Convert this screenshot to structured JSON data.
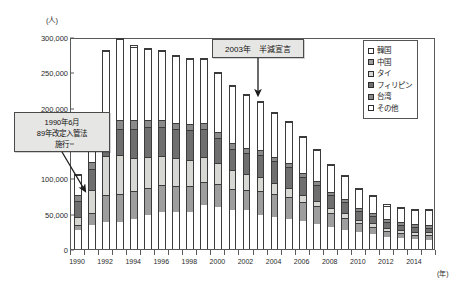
{
  "chart_data": {
    "type": "bar",
    "stacked": true,
    "title": "",
    "subtitle": "",
    "xlabel": "(年)",
    "ylabel": "(人)",
    "ylim": [
      0,
      300000
    ],
    "ytick_values": [
      0,
      50000,
      100000,
      150000,
      200000,
      250000,
      300000
    ],
    "ytick_labels": [
      "0",
      "50,000",
      "100,000",
      "150,000",
      "200,000",
      "250,000",
      "300,000"
    ],
    "grid": false,
    "legend_position": "top-right",
    "categories": [
      "1990",
      "1991",
      "1992",
      "1993",
      "1994",
      "1995",
      "1996",
      "1997",
      "1998",
      "1999",
      "2000",
      "2001",
      "2002",
      "2003",
      "2004",
      "2005",
      "2006",
      "2007",
      "2008",
      "2009",
      "2010",
      "2011",
      "2012",
      "2013",
      "2014",
      "2015"
    ],
    "xtick_labels": [
      "1990",
      "1992",
      "1994",
      "1996",
      "1998",
      "2000",
      "2002",
      "2004",
      "2006",
      "2008",
      "2010",
      "2012",
      "2014"
    ],
    "series": [
      {
        "name": "韓国",
        "color": "#ffffff",
        "values": [
          27000,
          35000,
          38000,
          39000,
          43000,
          48000,
          52000,
          52000,
          52000,
          62000,
          60000,
          56000,
          55000,
          49000,
          46000,
          43000,
          40000,
          36000,
          31000,
          27000,
          24000,
          22000,
          18000,
          16000,
          14000,
          13000
        ]
      },
      {
        "name": "中国",
        "color": "#9e9e9e",
        "values": [
          8000,
          17000,
          39000,
          39000,
          39000,
          39000,
          39000,
          38000,
          37000,
          34000,
          32000,
          30000,
          29000,
          33000,
          32000,
          31000,
          27000,
          25000,
          21000,
          18000,
          13000,
          10000,
          8000,
          7000,
          7000,
          8000
        ]
      },
      {
        "name": "タイ",
        "color": "#d7d7d4",
        "values": [
          11000,
          32000,
          55000,
          55000,
          47000,
          44000,
          41000,
          39000,
          38000,
          35000,
          30000,
          26000,
          23000,
          20000,
          16000,
          13000,
          10000,
          8000,
          7000,
          6000,
          5000,
          5000,
          4000,
          4000,
          4000,
          4000
        ]
      },
      {
        "name": "フィリピン",
        "color": "#6f6f6f",
        "values": [
          23000,
          30000,
          35000,
          38000,
          42000,
          42000,
          42000,
          42000,
          42000,
          40000,
          36000,
          31000,
          30000,
          32000,
          31000,
          30000,
          26000,
          23000,
          19000,
          17000,
          13000,
          11000,
          9000,
          8000,
          7000,
          6000
        ]
      },
      {
        "name": "台湾",
        "color": "#8a8a8a",
        "values": [
          9000,
          10000,
          11000,
          12000,
          12000,
          11000,
          10000,
          9000,
          9000,
          9000,
          8000,
          8000,
          7000,
          7000,
          6000,
          6000,
          5000,
          5000,
          4000,
          4000,
          4000,
          4000,
          4000,
          4000,
          4000,
          4000
        ]
      },
      {
        "name": "その他",
        "color": "#ffffff",
        "values": [
          28000,
          36000,
          104000,
          115000,
          105000,
          101000,
          98000,
          95000,
          93000,
          90000,
          85000,
          81000,
          76000,
          69000,
          63000,
          58000,
          52000,
          45000,
          38000,
          33000,
          27000,
          24000,
          20000,
          20000,
          21000,
          22000
        ]
      }
    ],
    "totals": [
      106000,
      160000,
      282000,
      298000,
      288000,
      285000,
      282000,
      275000,
      271000,
      270000,
      251000,
      232000,
      220000,
      210000,
      194000,
      181000,
      160000,
      142000,
      120000,
      105000,
      86000,
      76000,
      63000,
      59000,
      57000,
      57000
    ],
    "annotations": [
      {
        "id": "callout-1990",
        "lines": [
          "1990年6月",
          "89年改定入管法",
          "施行"
        ],
        "target_category": "1990"
      },
      {
        "id": "callout-2003",
        "lines": [
          "2003年　半減宣言"
        ],
        "target_category": "2003"
      }
    ]
  },
  "axes": {
    "y_unit": "(人)",
    "x_unit": "(年)"
  },
  "legend": {
    "items": [
      {
        "label": "韓国",
        "swatch": "korea-swatch"
      },
      {
        "label": "中国",
        "swatch": "china-swatch"
      },
      {
        "label": "タイ",
        "swatch": "thailand-swatch"
      },
      {
        "label": "フィリピン",
        "swatch": "philippines-swatch"
      },
      {
        "label": "台湾",
        "swatch": "taiwan-swatch"
      },
      {
        "label": "その他",
        "swatch": "other-swatch"
      }
    ]
  }
}
